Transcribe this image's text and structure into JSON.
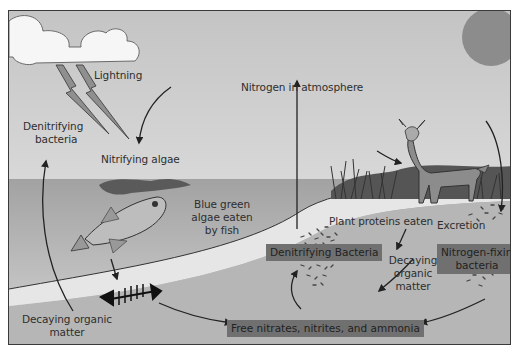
{
  "diagram": {
    "labels": {
      "lightning": "Lightning",
      "denitrifying_bacteria_line1": "Denitrifying",
      "denitrifying_bacteria_line2": "bacteria",
      "nitrifying_algae": "Nitrifying algae",
      "nitrogen_atmosphere": "Nitrogen in atmosphere",
      "blue_green_line1": "Blue green",
      "blue_green_line2": "algae eaten",
      "blue_green_line3": "by fish",
      "plant_proteins": "Plant proteins eaten",
      "excretion": "Excretion",
      "decaying_left_line1": "Decaying organic",
      "decaying_left_line2": "matter",
      "decaying_mid_line1": "Decaying",
      "decaying_mid_line2": "organic",
      "decaying_mid_line3": "matter"
    },
    "boxes": {
      "denitrifying_bacteria": "Denitrifying Bacteria",
      "nitrogen_fixing_line1": "Nitrogen-fixing",
      "nitrogen_fixing_line2": "bacteria",
      "free_nitrates": "Free nitrates, nitrites, and ammonia"
    },
    "colors": {
      "sky": "#cfcfcf",
      "water": "#a9a9a9",
      "shore": "#e4e4e4",
      "soil": "#b4b4b4",
      "sun": "#8a8a8a",
      "label_box": "#707070",
      "text": "#2e2e2e"
    },
    "icons": [
      "cloud-icon",
      "lightning-icon",
      "sun-icon",
      "fish-icon",
      "fish-skeleton-icon",
      "deer-icon",
      "grass-icon",
      "bacteria-icon"
    ]
  }
}
